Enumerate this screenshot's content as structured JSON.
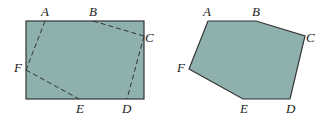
{
  "colors": {
    "fill": "#8fb1ad",
    "stroke": "#333333",
    "background": "#ffffff"
  },
  "left_figure": {
    "description": "Rectangle with dashed hexagon inscribed",
    "rectangle": {
      "x": 26,
      "y": 21,
      "width": 118,
      "height": 78
    },
    "labels": {
      "A": "A",
      "B": "B",
      "C": "C",
      "D": "D",
      "E": "E",
      "F": "F"
    }
  },
  "right_figure": {
    "description": "Hexagon ABCDEF cut from rectangle",
    "labels": {
      "A": "A",
      "B": "B",
      "C": "C",
      "D": "D",
      "E": "E",
      "F": "F"
    }
  }
}
